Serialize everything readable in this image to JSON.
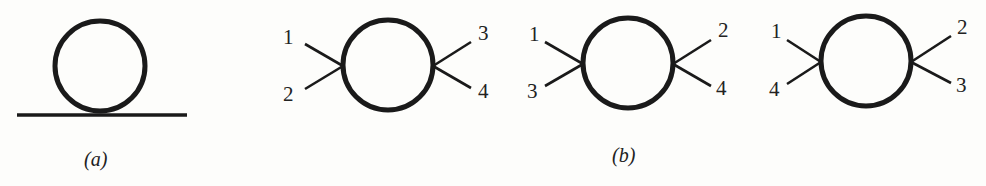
{
  "figure": {
    "panels": [
      {
        "id": "a",
        "caption": "(a)",
        "type": "tadpole",
        "circle": {
          "cx": 100,
          "cy": 66,
          "r": 45
        },
        "line": {
          "x1": 17,
          "y1": 115,
          "x2": 187,
          "y2": 115
        }
      },
      {
        "id": "b",
        "caption": "(b)",
        "diagrams": [
          {
            "circle": {
              "cx": 388,
              "cy": 65,
              "r": 45
            },
            "left_vertex": {
              "x": 343,
              "y": 66
            },
            "right_vertex": {
              "x": 433,
              "y": 66
            },
            "legs": {
              "top_left": {
                "x": 305,
                "y": 44,
                "label": "1"
              },
              "bottom_left": {
                "x": 305,
                "y": 89,
                "label": "2"
              },
              "top_right": {
                "x": 471,
                "y": 42,
                "label": "3"
              },
              "bottom_right": {
                "x": 471,
                "y": 88,
                "label": "4"
              }
            }
          },
          {
            "circle": {
              "cx": 628,
              "cy": 63,
              "r": 45
            },
            "left_vertex": {
              "x": 583,
              "y": 64
            },
            "right_vertex": {
              "x": 673,
              "y": 64
            },
            "legs": {
              "top_left": {
                "x": 545,
                "y": 42,
                "label": "1"
              },
              "bottom_left": {
                "x": 545,
                "y": 86,
                "label": "3"
              },
              "top_right": {
                "x": 711,
                "y": 40,
                "label": "2"
              },
              "bottom_right": {
                "x": 711,
                "y": 86,
                "label": "4"
              }
            }
          },
          {
            "circle": {
              "cx": 866,
              "cy": 61,
              "r": 45
            },
            "left_vertex": {
              "x": 821,
              "y": 62
            },
            "right_vertex": {
              "x": 911,
              "y": 62
            },
            "legs": {
              "top_left": {
                "x": 787,
                "y": 40,
                "label": "1"
              },
              "bottom_left": {
                "x": 787,
                "y": 84,
                "label": "4"
              },
              "top_right": {
                "x": 951,
                "y": 36,
                "label": "2"
              },
              "bottom_right": {
                "x": 951,
                "y": 83,
                "label": "3"
              }
            }
          }
        ]
      }
    ],
    "colors": {
      "ink": "#1a1a1a",
      "paper": "#fdfdfb"
    }
  }
}
